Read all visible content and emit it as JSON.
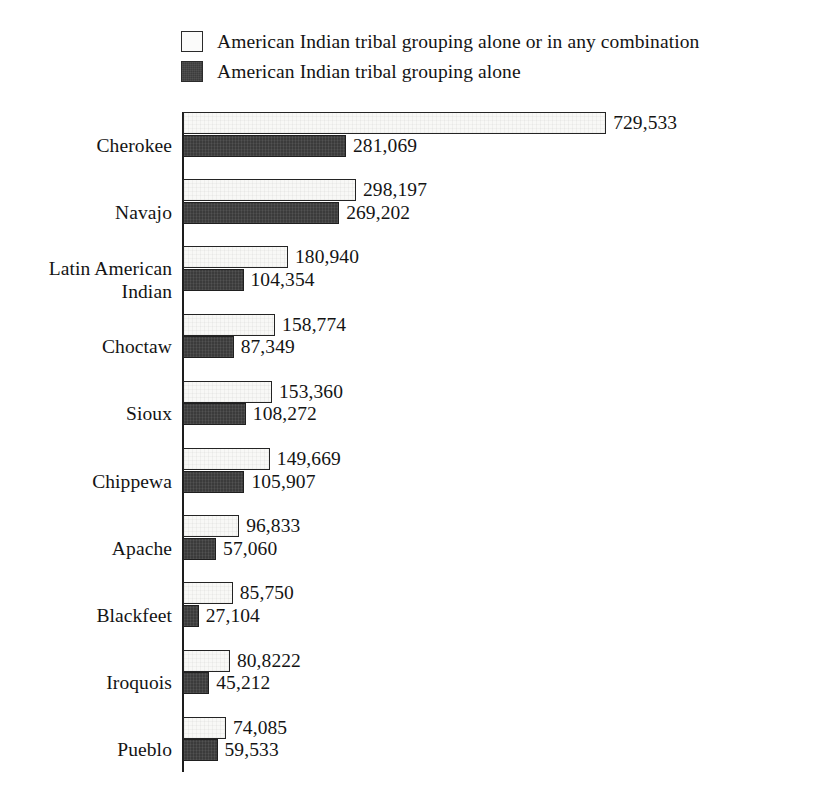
{
  "legend": {
    "items": [
      {
        "swatch": "light",
        "label": "American Indian tribal grouping alone or in any combination"
      },
      {
        "swatch": "dark",
        "label": "American Indian tribal grouping alone"
      }
    ]
  },
  "colors": {
    "light_fill": "#f8f8f6",
    "dark_fill": "#3b3b3b",
    "outline": "#242424",
    "axis": "#1d1d1d",
    "text": "#141414",
    "background": "#ffffff"
  },
  "chart_data": {
    "type": "bar",
    "orientation": "horizontal",
    "title": "",
    "subtitle": "",
    "xlabel": "",
    "ylabel": "",
    "grid": false,
    "legend_position": "top",
    "axis_visible": true,
    "xlim": [
      0,
      729533
    ],
    "categories": [
      "Cherokee",
      "Navajo",
      "Latin American\nIndian",
      "Choctaw",
      "Sioux",
      "Chippewa",
      "Apache",
      "Blackfeet",
      "Iroquois",
      "Pueblo"
    ],
    "series": [
      {
        "name": "American Indian tribal grouping alone or in any combination",
        "swatch": "light",
        "values": [
          729533,
          298197,
          180940,
          158774,
          153360,
          149669,
          96833,
          85750,
          80822,
          74085
        ],
        "labels": [
          "729,533",
          "298,197",
          "180,940",
          "158,774",
          "153,360",
          "149,669",
          "96,833",
          "85,750",
          "80,8222",
          "74,085"
        ]
      },
      {
        "name": "American Indian tribal grouping alone",
        "swatch": "dark",
        "values": [
          281069,
          269202,
          104354,
          87349,
          108272,
          105907,
          57060,
          27104,
          45212,
          59533
        ],
        "labels": [
          "281,069",
          "269,202",
          "104,354",
          "87,349",
          "108,272",
          "105,907",
          "57,060",
          "27,104",
          "45,212",
          "59,533"
        ]
      }
    ]
  },
  "geometry": {
    "axis_x": 183,
    "plot_top": 112,
    "group_pitch": 67.2,
    "bar_height": 22,
    "px_per_unit": 0.00058,
    "label_right_edge": 172,
    "value_gap": 7
  }
}
